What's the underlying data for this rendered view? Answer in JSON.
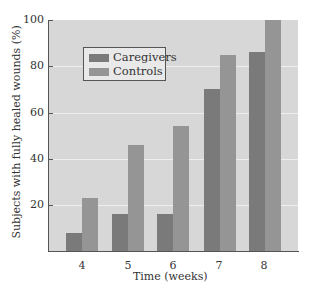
{
  "chart_data": {
    "type": "bar",
    "title": "",
    "xlabel": "Time (weeks)",
    "ylabel": "Subjects with fully healed wounds (%)",
    "categories": [
      "4",
      "5",
      "6",
      "7",
      "8"
    ],
    "series": [
      {
        "name": "Caregivers",
        "values": [
          8,
          16,
          16,
          70,
          86
        ],
        "color": "#7a7a7a"
      },
      {
        "name": "Controls",
        "values": [
          23,
          46,
          54,
          85,
          100
        ],
        "color": "#959595"
      }
    ],
    "ylim": [
      0,
      100
    ],
    "yticks": [
      "20",
      "40",
      "60",
      "80",
      "100"
    ],
    "grid": true,
    "legend_position": "upper left"
  },
  "legend": {
    "caregivers": "Caregivers",
    "controls": "Controls"
  },
  "axes": {
    "xlabel": "Time (weeks)",
    "ylabel": "Subjects with fully healed wounds (%)",
    "yticks": {
      "t20": "20",
      "t40": "40",
      "t60": "60",
      "t80": "80",
      "t100": "100"
    },
    "xticks": {
      "w4": "4",
      "w5": "5",
      "w6": "6",
      "w7": "7",
      "w8": "8"
    }
  }
}
